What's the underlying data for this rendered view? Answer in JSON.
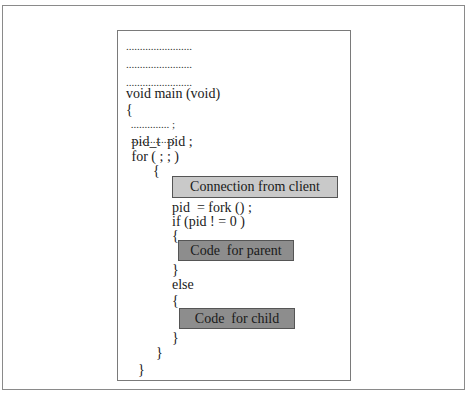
{
  "figure": {
    "placeholder_lines": [
      "........................",
      "........................",
      "........................"
    ],
    "code_lines": [
      "void main (void)",
      "{",
      " .............. ;",
      " ...............;",
      " pid_t  pid ;",
      " for ( ; ; )",
      "{",
      "pid  = fork () ;",
      "if (pid ! = 0 )",
      "{",
      "}",
      "else",
      "{",
      "}",
      "}",
      "}"
    ],
    "blocks": {
      "connection": "Connection from client",
      "parent": "Code  for parent",
      "child": "Code  for child"
    },
    "colors": {
      "connection_fill": "#c9c9c9",
      "code_fill": "#8d8d8d",
      "border": "#7a7a7a"
    }
  }
}
